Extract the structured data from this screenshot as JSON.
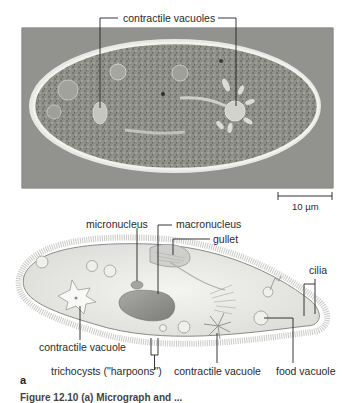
{
  "figure": {
    "photo": {
      "label_top": "contractile vacuoles",
      "scale_bar": "10 µm"
    },
    "diagram": {
      "labels": {
        "micronucleus": "micronucleus",
        "macronucleus": "macronucleus",
        "gullet": "gullet",
        "cilia": "cilia",
        "contractile_vacuole_left": "contractile vacuole",
        "trichocysts": "trichocysts (\"harpoons\")",
        "contractile_vacuole_right": "contractile vacuole",
        "food_vacuole": "food vacuole"
      },
      "panel_letter": "a"
    },
    "caption": "Figure 12.10  (a) Micrograph and ..."
  }
}
